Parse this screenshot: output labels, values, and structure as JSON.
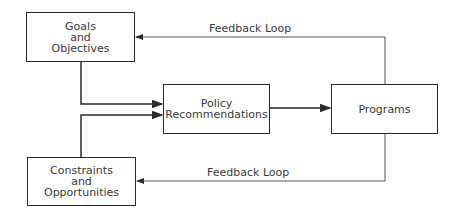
{
  "diagram": {
    "nodes": {
      "goals": {
        "lines": [
          "Goals",
          "and",
          "Objectives"
        ]
      },
      "constraints": {
        "lines": [
          "Constraints",
          "and",
          "Opportunities"
        ]
      },
      "policy": {
        "lines": [
          "Policy",
          "Recommendations"
        ]
      },
      "programs": {
        "lines": [
          "Programs"
        ]
      }
    },
    "edges": {
      "feedback_top": {
        "label": "Feedback Loop",
        "from": "Programs",
        "to": "Goals and Objectives"
      },
      "feedback_bottom": {
        "label": "Feedback Loop",
        "from": "Programs",
        "to": "Constraints and Opportunities"
      },
      "goals_to_policy": {
        "from": "Goals and Objectives",
        "to": "Policy Recommendations"
      },
      "constraints_to_policy": {
        "from": "Constraints and Opportunities",
        "to": "Policy Recommendations"
      },
      "policy_to_programs": {
        "from": "Policy Recommendations",
        "to": "Programs"
      }
    }
  }
}
